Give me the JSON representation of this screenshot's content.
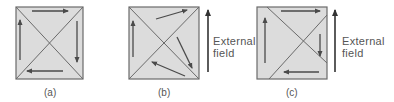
{
  "figure": {
    "panels": [
      {
        "id": "a",
        "label": "(a)",
        "square": {
          "x": 16,
          "y": 7,
          "w": 67,
          "h": 72
        },
        "diagonals": [
          [
            16,
            7,
            83,
            79
          ],
          [
            16,
            79,
            83,
            7
          ]
        ],
        "arrows": [
          {
            "from": [
              32,
              11
            ],
            "to": [
              68,
              11
            ]
          },
          {
            "from": [
              77,
              21
            ],
            "to": [
              77,
              62
            ]
          },
          {
            "from": [
              63,
              71
            ],
            "to": [
              27,
              71
            ]
          },
          {
            "from": [
              20,
              60
            ],
            "to": [
              20,
              20
            ]
          }
        ],
        "external_field": null
      },
      {
        "id": "b",
        "label": "(b)",
        "square": {
          "x": 129,
          "y": 7,
          "w": 70,
          "h": 72
        },
        "diagonals": [
          [
            129,
            7,
            199,
            79
          ],
          [
            129,
            79,
            199,
            7
          ]
        ],
        "arrows": [
          {
            "from": [
              133,
              57
            ],
            "to": [
              133,
              21
            ]
          },
          {
            "from": [
              156,
              19
            ],
            "to": [
              187,
              10
            ]
          },
          {
            "from": [
              177,
              37
            ],
            "to": [
              192,
              68
            ]
          },
          {
            "from": [
              185,
              76
            ],
            "to": [
              152,
              62
            ]
          }
        ],
        "external_field": {
          "line1": "External",
          "line2": "field",
          "arrow_x": 208,
          "arrow_top": 10,
          "arrow_bottom": 72
        }
      },
      {
        "id": "c",
        "label": "(c)",
        "square": {
          "x": 257,
          "y": 7,
          "w": 70,
          "h": 72
        },
        "diagonals": [
          [
            267,
            7,
            327,
            63
          ],
          [
            269,
            79,
            327,
            15
          ]
        ],
        "arrows": [
          {
            "from": [
              281,
              11
            ],
            "to": [
              320,
              11
            ]
          },
          {
            "from": [
              320,
              34
            ],
            "to": [
              320,
              56
            ]
          },
          {
            "from": [
              319,
              72
            ],
            "to": [
              284,
              72
            ]
          },
          {
            "from": [
              265,
              63
            ],
            "to": [
              265,
              18
            ]
          }
        ],
        "external_field": {
          "line1": "External",
          "line2": "field",
          "arrow_x": 335,
          "arrow_top": 10,
          "arrow_bottom": 72
        }
      }
    ],
    "colors": {
      "fill": "#dcdcdc",
      "border": "#6a6a6a",
      "arrow": "#4a4a4a",
      "text": "#555555"
    }
  }
}
